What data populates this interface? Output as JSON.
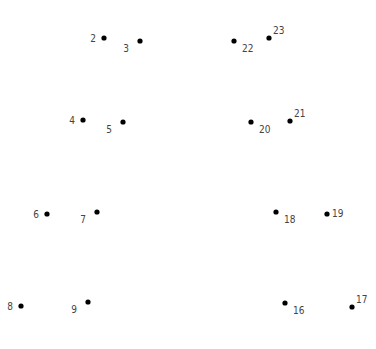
{
  "puzzle": {
    "type": "connect-the-dots",
    "dots": [
      {
        "n": "2",
        "label_pos": "left"
      },
      {
        "n": "3",
        "label_pos": "below-left"
      },
      {
        "n": "4",
        "label_pos": "left"
      },
      {
        "n": "5",
        "label_pos": "below-left"
      },
      {
        "n": "6",
        "label_pos": "left"
      },
      {
        "n": "7",
        "label_pos": "below-left"
      },
      {
        "n": "8",
        "label_pos": "left"
      },
      {
        "n": "9",
        "label_pos": "below-left"
      },
      {
        "n": "16",
        "label_pos": "below-right"
      },
      {
        "n": "17",
        "label_pos": "above-right"
      },
      {
        "n": "18",
        "label_pos": "below-right"
      },
      {
        "n": "19",
        "label_pos": "right"
      },
      {
        "n": "20",
        "label_pos": "below-right"
      },
      {
        "n": "21",
        "label_pos": "above-right"
      },
      {
        "n": "22",
        "label_pos": "below-right"
      },
      {
        "n": "23",
        "label_pos": "above-right"
      }
    ]
  }
}
